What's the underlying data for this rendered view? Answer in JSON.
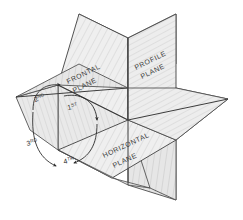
{
  "figure": {
    "kind": "technical-illustration",
    "style": "hand-drawn pencil sketch with hatched shading",
    "background_color": "#ffffff",
    "line_color": "#4a4a4a",
    "shade_light": "#f0f0f0",
    "shade_mid": "#e4e4e4",
    "shade_dark": "#d6d6d6"
  },
  "planes": [
    {
      "id": "frontal",
      "label_line1": "FRONTAL",
      "label_line2": "PLANE"
    },
    {
      "id": "profile",
      "label_line1": "PROFILE",
      "label_line2": "PLANE"
    },
    {
      "id": "horizontal",
      "label_line1": "HORIZONTAL",
      "label_line2": "PLANE"
    }
  ],
  "quadrants": [
    {
      "id": "first",
      "ordinal": "1",
      "suffix": "ST"
    },
    {
      "id": "second",
      "ordinal": "2",
      "suffix": "ND"
    },
    {
      "id": "third",
      "ordinal": "3",
      "suffix": "RD"
    },
    {
      "id": "fourth",
      "ordinal": "4",
      "suffix": "TH"
    }
  ]
}
